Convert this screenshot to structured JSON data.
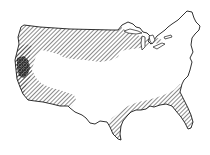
{
  "map": {
    "subject": "Contiguous United States outline",
    "style": "black-and-white line drawing with diagonal hatching",
    "colors": {
      "background": "#ffffff",
      "outline": "#1a1a1a",
      "hatch": "#2a2a2a"
    },
    "regions": [
      {
        "id": "north-central-northwest",
        "label": "Northwest and northern plains",
        "pattern": "diagonal-hatch"
      },
      {
        "id": "west-coast",
        "label": "Pacific coast strip",
        "pattern": "diagonal-hatch"
      },
      {
        "id": "california-interior",
        "label": "California dense area",
        "pattern": "cross-hatch"
      },
      {
        "id": "southwest",
        "label": "Southwest strip",
        "pattern": "diagonal-hatch"
      },
      {
        "id": "gulf-coast-florida",
        "label": "Gulf coast and Florida",
        "pattern": "diagonal-hatch"
      }
    ]
  }
}
